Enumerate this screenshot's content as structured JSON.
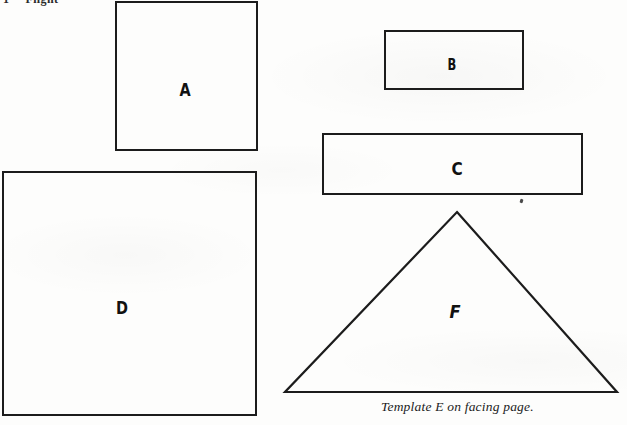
{
  "page": {
    "background_color": "#fdfdfc",
    "ink_color": "#1c1c1c",
    "width": 627,
    "height": 425
  },
  "running_head": {
    "folio": "1",
    "title": "Flight"
  },
  "shapes": [
    {
      "id": "A",
      "label": "A",
      "type": "square",
      "x": 115,
      "y": 1,
      "width": 143,
      "height": 150
    },
    {
      "id": "B",
      "label": "B",
      "type": "rectangle",
      "x": 384,
      "y": 30,
      "width": 140,
      "height": 60
    },
    {
      "id": "C",
      "label": "C",
      "type": "rectangle",
      "x": 322,
      "y": 133,
      "width": 261,
      "height": 62
    },
    {
      "id": "D",
      "label": "D",
      "type": "square",
      "x": 2,
      "y": 171,
      "width": 255,
      "height": 245
    },
    {
      "id": "F",
      "label": "F",
      "type": "triangle",
      "x": 280,
      "y": 205,
      "width": 342,
      "height": 195,
      "apex": [
        177,
        7
      ],
      "base_left": [
        5,
        187
      ],
      "base_right": [
        337,
        187
      ]
    }
  ],
  "caption": {
    "text": "Template E on facing page."
  },
  "artifacts": {
    "speck": "scan-speck"
  }
}
